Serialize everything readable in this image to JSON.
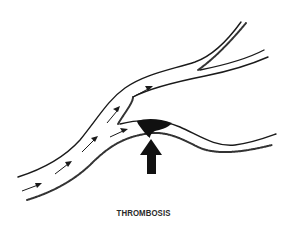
{
  "figure": {
    "caption": "THROMBOSIS",
    "elements": {
      "vessel": "branching artery",
      "flow_arrows": 8,
      "thrombus": "dark clot at branch entrance",
      "indicator_arrow": "large upward arrow pointing at clot"
    },
    "colors": {
      "ink": "#1a1a1a",
      "background": "#ffffff"
    }
  }
}
